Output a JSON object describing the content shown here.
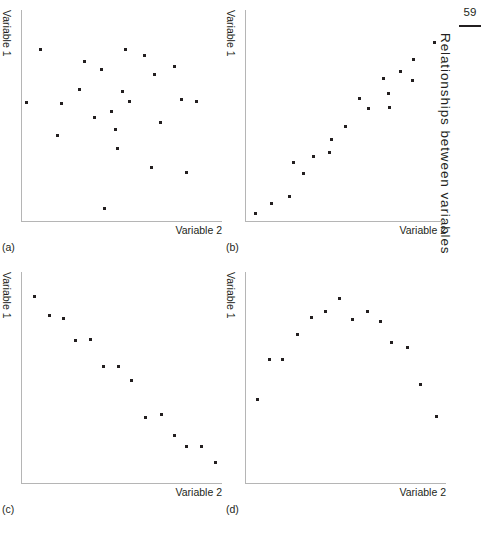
{
  "page": {
    "folio": "59",
    "running_head": "Relationships between variables"
  },
  "panels": [
    {
      "tag": "(a)",
      "ylabel": "Variable 1",
      "xlabel": "Variable 2"
    },
    {
      "tag": "(b)",
      "ylabel": "Variable 1",
      "xlabel": "Variable 2"
    },
    {
      "tag": "(c)",
      "ylabel": "Variable 1",
      "xlabel": "Variable 2"
    },
    {
      "tag": "(d)",
      "ylabel": "Variable 1",
      "xlabel": "Variable 2"
    }
  ],
  "chart_data": [
    {
      "type": "scatter",
      "title": "(a)",
      "annotation": "no relationship / random scatter",
      "xlabel": "Variable 2",
      "ylabel": "Variable 1",
      "xlim": [
        0,
        100
      ],
      "ylim": [
        0,
        100
      ],
      "grid": false,
      "legend": "none",
      "points": [
        [
          9.0,
          81.5
        ],
        [
          2.0,
          56.0
        ],
        [
          19.5,
          55.5
        ],
        [
          17.5,
          40.5
        ],
        [
          28.5,
          62.5
        ],
        [
          31.0,
          75.5
        ],
        [
          36.0,
          49.0
        ],
        [
          39.5,
          72.0
        ],
        [
          44.5,
          52.0
        ],
        [
          46.5,
          43.5
        ],
        [
          47.5,
          34.5
        ],
        [
          50.0,
          61.5
        ],
        [
          51.5,
          81.5
        ],
        [
          53.5,
          56.5
        ],
        [
          61.0,
          78.5
        ],
        [
          64.5,
          25.5
        ],
        [
          66.0,
          69.5
        ],
        [
          69.0,
          46.5
        ],
        [
          76.0,
          73.0
        ],
        [
          79.5,
          57.5
        ],
        [
          82.0,
          23.0
        ],
        [
          87.0,
          56.5
        ],
        [
          41.0,
          6.0
        ]
      ]
    },
    {
      "type": "scatter",
      "title": "(b)",
      "annotation": "strong positive linear relationship",
      "xlabel": "Variable 2",
      "ylabel": "Variable 1",
      "xlim": [
        0,
        100
      ],
      "ylim": [
        0,
        100
      ],
      "grid": false,
      "legend": "none",
      "points": [
        [
          4.5,
          3.5
        ],
        [
          12.5,
          8.5
        ],
        [
          21.5,
          11.5
        ],
        [
          23.5,
          27.5
        ],
        [
          28.5,
          22.5
        ],
        [
          33.5,
          30.5
        ],
        [
          41.5,
          32.5
        ],
        [
          42.5,
          38.5
        ],
        [
          49.5,
          45.0
        ],
        [
          56.5,
          58.0
        ],
        [
          61.0,
          53.5
        ],
        [
          68.5,
          67.5
        ],
        [
          71.0,
          60.5
        ],
        [
          71.5,
          54.0
        ],
        [
          77.0,
          71.0
        ],
        [
          83.5,
          76.5
        ],
        [
          83.0,
          66.5
        ],
        [
          94.0,
          84.5
        ]
      ]
    },
    {
      "type": "scatter",
      "title": "(c)",
      "annotation": "strong negative linear relationship",
      "xlabel": "Variable 2",
      "ylabel": "Variable 1",
      "xlim": [
        0,
        100
      ],
      "ylim": [
        0,
        100
      ],
      "grid": false,
      "legend": "none",
      "points": [
        [
          6.0,
          88.5
        ],
        [
          13.5,
          79.5
        ],
        [
          20.5,
          78.0
        ],
        [
          26.5,
          67.5
        ],
        [
          34.0,
          68.0
        ],
        [
          40.5,
          55.0
        ],
        [
          48.0,
          55.0
        ],
        [
          54.5,
          48.5
        ],
        [
          61.5,
          31.0
        ],
        [
          69.5,
          32.5
        ],
        [
          76.0,
          22.5
        ],
        [
          82.0,
          17.5
        ],
        [
          89.5,
          17.5
        ],
        [
          96.5,
          9.5
        ],
        [
          0.0,
          0.0
        ]
      ]
    },
    {
      "type": "scatter",
      "title": "(d)",
      "annotation": "curvilinear (inverted-U) relationship",
      "xlabel": "Variable 2",
      "ylabel": "Variable 1",
      "xlim": [
        0,
        100
      ],
      "ylim": [
        0,
        100
      ],
      "grid": false,
      "legend": "none",
      "points": [
        [
          5.5,
          39.5
        ],
        [
          11.5,
          58.5
        ],
        [
          18.0,
          58.5
        ],
        [
          25.5,
          70.5
        ],
        [
          32.5,
          78.5
        ],
        [
          39.5,
          81.5
        ],
        [
          46.5,
          87.5
        ],
        [
          53.0,
          77.5
        ],
        [
          60.5,
          81.5
        ],
        [
          67.0,
          76.5
        ],
        [
          72.5,
          66.5
        ],
        [
          80.5,
          64.0
        ],
        [
          87.0,
          46.5
        ],
        [
          95.0,
          31.5
        ],
        [
          0.0,
          0.0
        ],
        [
          0.0,
          0.0
        ]
      ]
    }
  ]
}
